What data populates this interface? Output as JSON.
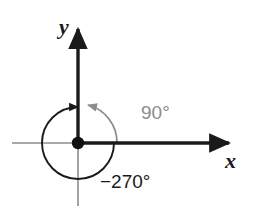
{
  "figure": {
    "type": "angle-diagram",
    "background_color": "#ffffff",
    "axes": {
      "x_label": "x",
      "y_label": "y",
      "x_axis_color": "#1a1a1a",
      "y_axis_color": "#1a1a1a",
      "minor_axis_color": "#8c8c8c",
      "origin": {
        "x": 78,
        "y": 143
      },
      "x_positive_end": {
        "x": 236,
        "y": 143
      },
      "x_negative_end": {
        "x": 12,
        "y": 143
      },
      "y_positive_end": {
        "x": 78,
        "y": 22
      },
      "y_negative_end": {
        "x": 78,
        "y": 206
      },
      "origin_dot_color": "#111111",
      "origin_dot_radius": 6
    },
    "angles": [
      {
        "name": "positive-angle",
        "label": "90°",
        "measure_degrees": 90,
        "direction": "counterclockwise",
        "color": "#8c8c8c",
        "arc_radius": 39,
        "start_degrees": 0,
        "end_degrees": 90,
        "label_position": {
          "x": 141,
          "y": 119
        }
      },
      {
        "name": "negative-angle",
        "label": "−270°",
        "measure_degrees": -270,
        "direction": "clockwise",
        "color": "#1a1a1a",
        "arc_radius": 36,
        "start_degrees": 0,
        "end_degrees": -270,
        "label_position": {
          "x": 118,
          "y": 181
        }
      }
    ],
    "terminal_ray": {
      "name": "terminal-side",
      "description": "terminal side along positive y-axis",
      "color": "#1a1a1a"
    }
  }
}
